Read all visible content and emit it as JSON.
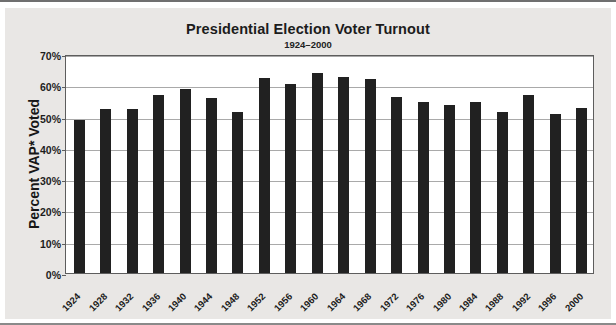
{
  "chart_data": {
    "type": "bar",
    "title": "Presidential Election Voter Turnout",
    "subtitle": "1924–2000",
    "xlabel": "",
    "ylabel": "Percent VAP* Voted",
    "ylim": [
      0,
      70
    ],
    "ytick_labels": [
      "70%",
      "60%",
      "50%",
      "40%",
      "30%",
      "20%",
      "10%",
      "0%"
    ],
    "ytick_values": [
      70,
      60,
      50,
      40,
      30,
      20,
      10,
      0
    ],
    "grid": true,
    "legend": "none",
    "bar_color": "#212121",
    "plot_background": "#ffffff",
    "figure_background": "#e9e7e5",
    "categories": [
      "1924",
      "1928",
      "1932",
      "1936",
      "1940",
      "1944",
      "1948",
      "1952",
      "1956",
      "1960",
      "1964",
      "1968",
      "1972",
      "1976",
      "1980",
      "1984",
      "1988",
      "1992",
      "1996",
      "2000"
    ],
    "values": [
      48.9,
      52.4,
      52.5,
      56.9,
      58.9,
      56.0,
      51.5,
      62.3,
      60.4,
      63.8,
      62.8,
      61.9,
      56.2,
      54.8,
      53.6,
      54.8,
      51.6,
      57.0,
      50.8,
      52.6
    ]
  }
}
